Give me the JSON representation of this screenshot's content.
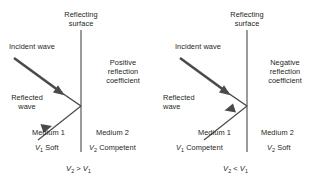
{
  "figure": {
    "type": "physics-diagram",
    "stroke_color": "#3b3b3b",
    "text_color": "#231f20",
    "background": "#ffffff"
  },
  "panels": [
    {
      "id": "left",
      "reflecting_surface_label": "Reflecting\nsurface",
      "reflecting_surface_line1": "Reflecting",
      "reflecting_surface_line2": "surface",
      "incident_wave_label": "Incident wave",
      "reflected_wave_label": "Reflected\nwave",
      "reflected_wave_line1": "Reflected",
      "reflected_wave_line2": "wave",
      "coefficient_label": "Positive\nreflection\ncoefficient",
      "coefficient_line1": "Positive",
      "coefficient_line2": "reflection",
      "coefficient_line3": "coefficient",
      "medium_left_name": "Medium 1",
      "medium_left_velocity_symbol": "V",
      "medium_left_velocity_subscript": "1",
      "medium_left_property": "Soft",
      "medium_right_name": "Medium 2",
      "medium_right_velocity_symbol": "V",
      "medium_right_velocity_subscript": "2",
      "medium_right_property": "Competent",
      "inequality": "V2 > V1",
      "inequality_left_symbol": "V",
      "inequality_left_subscript": "2",
      "inequality_operator": ">",
      "inequality_right_symbol": "V",
      "inequality_right_subscript": "1",
      "reflected_arrow_direction": "away-from-surface-down-left",
      "reflected_arrow_polarity": "positive"
    },
    {
      "id": "right",
      "reflecting_surface_label": "Reflecting\nsurface",
      "reflecting_surface_line1": "Reflecting",
      "reflecting_surface_line2": "surface",
      "incident_wave_label": "Incident wave",
      "reflected_wave_label": "Reflected\nwave",
      "reflected_wave_line1": "Reflected",
      "reflected_wave_line2": "wave",
      "coefficient_label": "Negative\nreflection\ncoefficient",
      "coefficient_line1": "Negative",
      "coefficient_line2": "reflection",
      "coefficient_line3": "coefficient",
      "medium_left_name": "Medium 1",
      "medium_left_velocity_symbol": "V",
      "medium_left_velocity_subscript": "1",
      "medium_left_property": "Competent",
      "medium_right_name": "Medium 2",
      "medium_right_velocity_symbol": "V",
      "medium_right_velocity_subscript": "2",
      "medium_right_property": "Soft",
      "inequality": "V2 < V1",
      "inequality_left_symbol": "V",
      "inequality_left_subscript": "2",
      "inequality_operator": "<",
      "inequality_right_symbol": "V",
      "inequality_right_subscript": "1",
      "reflected_arrow_direction": "toward-surface-up-right",
      "reflected_arrow_polarity": "negative"
    }
  ]
}
